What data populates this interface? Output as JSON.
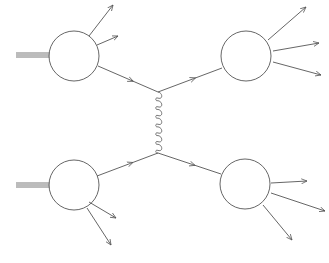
{
  "diagram": {
    "type": "feynman-like hadron collision diagram",
    "stroke_color": "#555555",
    "background": "#ffffff",
    "blobs": [
      {
        "id": "top-left",
        "cx": 74,
        "cy": 56,
        "r": 25,
        "incoming_beam_y": 55
      },
      {
        "id": "top-right",
        "cx": 246,
        "cy": 56,
        "r": 25
      },
      {
        "id": "bottom-left",
        "cx": 74,
        "cy": 185,
        "r": 25,
        "incoming_beam_y": 185
      },
      {
        "id": "bottom-right",
        "cx": 245,
        "cy": 184,
        "r": 25
      }
    ],
    "vertices": [
      {
        "id": "top-vertex",
        "x": 158,
        "y": 92
      },
      {
        "id": "bottom-vertex",
        "x": 158,
        "y": 153
      }
    ],
    "gluon": {
      "from": "top-vertex",
      "to": "bottom-vertex",
      "loops": 7
    },
    "outgoing_arrows": {
      "top-left": [
        [
          89,
          36,
          113,
          5
        ],
        [
          97,
          45,
          118,
          36
        ]
      ],
      "top-right": [
        [
          268,
          40,
          306,
          7
        ],
        [
          273,
          51,
          319,
          43
        ],
        [
          273,
          62,
          321,
          75
        ]
      ],
      "bottom-left": [
        [
          89,
          202,
          116,
          218
        ],
        [
          87,
          208,
          111,
          245
        ]
      ],
      "bottom-right": [
        [
          271,
          183,
          307,
          181
        ],
        [
          271,
          193,
          325,
          211
        ],
        [
          263,
          205,
          292,
          240
        ]
      ]
    },
    "internal_lines": [
      {
        "from": [
          98,
          66
        ],
        "to": [
          158,
          92
        ],
        "arrow": true
      },
      {
        "from": [
          158,
          92
        ],
        "to": [
          222,
          68
        ],
        "arrow": true
      },
      {
        "from": [
          97,
          176
        ],
        "to": [
          158,
          153
        ],
        "arrow": true
      },
      {
        "from": [
          158,
          153
        ],
        "to": [
          221,
          174
        ],
        "arrow": true
      }
    ]
  }
}
